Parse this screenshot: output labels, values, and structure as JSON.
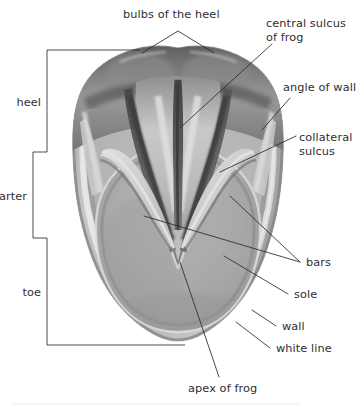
{
  "figure": {
    "style": "graphite pencil drawing, grayscale"
  },
  "labels": {
    "bulbs_of_the_heel": "bulbs of the heel",
    "central_sulcus_of_frog_line1": "central sulcus",
    "central_sulcus_of_frog_line2": "of frog",
    "angle_of_wall": "angle of wall",
    "collateral_sulcus_line1": "collateral",
    "collateral_sulcus_line2": "sulcus",
    "bars": "bars",
    "sole": "sole",
    "wall": "wall",
    "white_line": "white line",
    "apex_of_frog": "apex of frog",
    "heel": "heel",
    "quarter": "quarter",
    "toe": "toe"
  },
  "colors": {
    "background": "#ffffff",
    "text": "#2e2e33",
    "leader_line": "#2b2b30",
    "hoof_wall_light": "#cdcdcd",
    "hoof_sole_mid": "#b4b4b4",
    "frog_dark": "#3a3a3a",
    "white_line_highlight": "#fbfbfb"
  },
  "regions": [
    {
      "name": "bulbs of the heel",
      "position": "top"
    },
    {
      "name": "central sulcus of frog",
      "position": "upper-center"
    },
    {
      "name": "angle of wall",
      "position": "upper-right"
    },
    {
      "name": "collateral sulcus",
      "position": "mid-right"
    },
    {
      "name": "bars",
      "position": "mid-right"
    },
    {
      "name": "sole",
      "position": "lower-center"
    },
    {
      "name": "wall",
      "position": "outer-rim"
    },
    {
      "name": "white line",
      "position": "outer-rim-inner-edge"
    },
    {
      "name": "apex of frog",
      "position": "lower-center"
    }
  ],
  "brackets": [
    {
      "name": "heel",
      "label": "heel",
      "side": "left"
    },
    {
      "name": "quarter",
      "label": "quarter",
      "side": "left"
    },
    {
      "name": "toe",
      "label": "toe",
      "side": "left"
    }
  ]
}
